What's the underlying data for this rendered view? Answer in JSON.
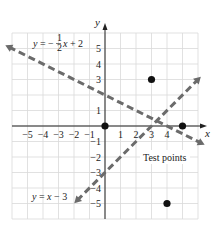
{
  "chart_data": {
    "type": "line",
    "title": "",
    "xlabel": "x",
    "ylabel": "y",
    "xlim": [
      -6,
      6
    ],
    "ylim": [
      -6,
      6
    ],
    "grid": true,
    "x_ticks": [
      -5,
      -4,
      -3,
      -2,
      -1,
      1,
      2,
      3,
      4
    ],
    "y_ticks": [
      5,
      4,
      3,
      1,
      -1,
      -2,
      -3,
      -4,
      -5
    ],
    "series": [
      {
        "name": "y = -1/2 x + 2",
        "label_parts": {
          "lhs": "y = −",
          "num": "1",
          "den": "2",
          "rhs": "x + 2"
        },
        "style": "dashed",
        "color": "#6b6b6b",
        "x": [
          -6.2,
          6.2
        ],
        "y": [
          5.1,
          -1.1
        ]
      },
      {
        "name": "y = x - 3",
        "label": "y = x − 3",
        "style": "dashed",
        "color": "#6b6b6b",
        "x": [
          -1.8,
          6
        ],
        "y": [
          -4.8,
          3
        ]
      }
    ],
    "points": [
      {
        "x": 0,
        "y": 0
      },
      {
        "x": 3,
        "y": 3
      },
      {
        "x": 5,
        "y": 0
      },
      {
        "x": 4,
        "y": -5
      }
    ],
    "annotations": [
      {
        "text": "Test points"
      }
    ]
  }
}
